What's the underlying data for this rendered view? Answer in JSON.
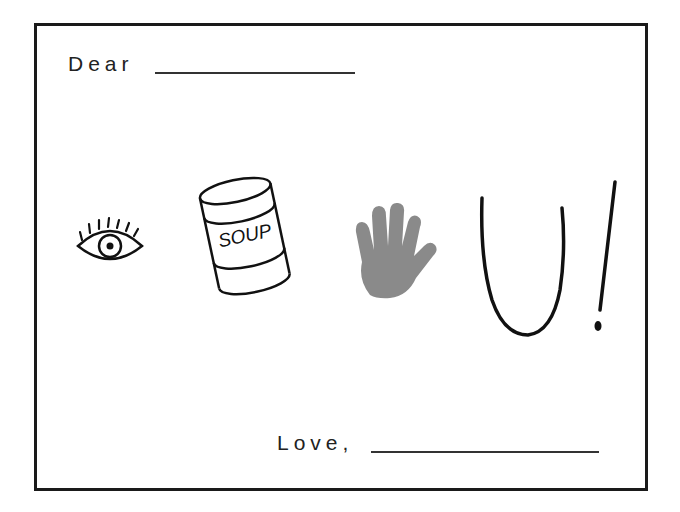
{
  "card": {
    "greeting": "Dear",
    "closing": "Love,"
  },
  "rebus": {
    "items": [
      {
        "icon": "eye-icon",
        "meaning": "I"
      },
      {
        "icon": "soup-can-icon",
        "label": "SOUP",
        "meaning": "soup"
      },
      {
        "icon": "hand-icon",
        "meaning": "hand"
      },
      {
        "icon": "letter-u-icon",
        "meaning": "U"
      },
      {
        "icon": "exclamation-icon",
        "meaning": "!"
      }
    ]
  },
  "colors": {
    "border": "#1a1a1a",
    "ink": "#222222",
    "hand_fill": "#8a8a8a"
  }
}
